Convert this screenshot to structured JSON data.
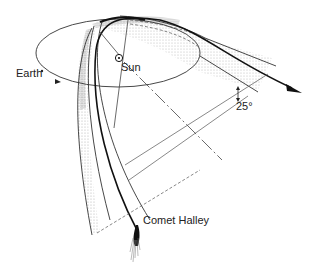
{
  "diagram": {
    "labels": {
      "earth": "Earth",
      "sun": "Sun",
      "comet": "Comet Halley",
      "inclination": "25°"
    },
    "elements": [
      {
        "id": "earth-orbit",
        "type": "ellipse",
        "desc": "Earth's orbital plane (ecliptic)"
      },
      {
        "id": "sun-marker",
        "type": "symbol",
        "desc": "Sun symbol ⊙ at orbit focus"
      },
      {
        "id": "comet-orbit",
        "type": "curve",
        "desc": "Comet Halley orbit, bold line with direction arrow"
      },
      {
        "id": "dust-tail-bands",
        "type": "shaded-band",
        "desc": "Stippled bands showing comet envelope"
      },
      {
        "id": "angle-25",
        "type": "annotation",
        "desc": "25° inclination angle between planes"
      },
      {
        "id": "comet-nucleus",
        "type": "symbol",
        "desc": "Comet head with tail at bottom"
      }
    ],
    "colors": {
      "line": "#222222",
      "stipple": "#999999",
      "background": "#ffffff"
    }
  }
}
